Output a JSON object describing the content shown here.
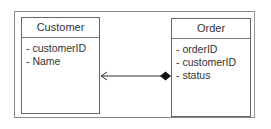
{
  "diagram": {
    "type": "UML class diagram",
    "classes": [
      {
        "name": "Customer",
        "attributes": [
          "- customerID",
          "- Name"
        ]
      },
      {
        "name": "Order",
        "attributes": [
          "- orderID",
          "- customerID",
          "- status"
        ]
      }
    ],
    "relationship": {
      "kind": "composition",
      "whole": "Order",
      "part": "Customer",
      "navigable_toward": "Customer",
      "source_end": "filled-diamond",
      "target_end": "open-arrow"
    },
    "colors": {
      "line": "#333333",
      "border": "#666666",
      "frame": "#8a8a8a",
      "text": "#333333"
    }
  }
}
